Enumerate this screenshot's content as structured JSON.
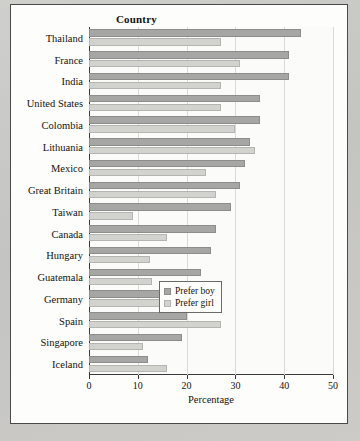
{
  "chart_data": {
    "type": "bar",
    "orientation": "horizontal",
    "title": "",
    "xlabel": "Percentage",
    "ylabel": "Country",
    "xlim": [
      0,
      50
    ],
    "xticks": [
      0,
      10,
      20,
      30,
      40,
      50
    ],
    "grid": true,
    "legend_position": "lower-right-inside",
    "categories": [
      "Thailand",
      "France",
      "India",
      "United States",
      "Colombia",
      "Lithuania",
      "Mexico",
      "Great Britain",
      "Taiwan",
      "Canada",
      "Hungary",
      "Guatemala",
      "Germany",
      "Spain",
      "Singapore",
      "Iceland"
    ],
    "series": [
      {
        "name": "Prefer boy",
        "color": "#a6a6a4",
        "values": [
          43.5,
          41,
          41,
          35,
          35,
          33,
          32,
          31,
          29,
          26,
          25,
          23,
          21,
          20,
          19,
          12
        ]
      },
      {
        "name": "Prefer girl",
        "color": "#d2d2cf",
        "values": [
          27,
          31,
          27,
          27,
          30,
          34,
          24,
          26,
          9,
          16,
          12.5,
          13,
          20,
          27,
          11,
          16
        ]
      }
    ]
  },
  "legend": {
    "items": [
      {
        "label": "Prefer boy"
      },
      {
        "label": "Prefer girl"
      }
    ]
  }
}
